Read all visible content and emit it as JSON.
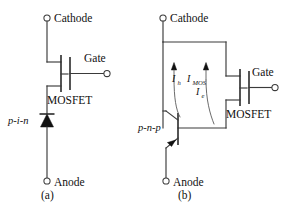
{
  "figure": {
    "caption_a": "(a)",
    "caption_b": "(b)",
    "background": "#ffffff",
    "line_color": "#3a3a3a"
  },
  "circuit_a": {
    "name": "MOS-gated p-i-n diode equivalent circuit",
    "terminals": {
      "top_label": "Cathode",
      "bottom_label": "Anode",
      "gate_label": "Gate"
    },
    "devices": [
      {
        "id": "mosfet-a",
        "label": "MOSFET",
        "type": "n-channel-mosfet"
      },
      {
        "id": "pin-diode-a",
        "label": "p-i-n",
        "type": "diode"
      }
    ],
    "caption": "(a)"
  },
  "circuit_b": {
    "name": "IGBT equivalent circuit with pnp bipolar and MOSFET",
    "terminals": {
      "top_label": "Cathode",
      "bottom_label": "Anode",
      "gate_label": "Gate"
    },
    "devices": [
      {
        "id": "mosfet-b",
        "label": "MOSFET",
        "type": "n-channel-mosfet"
      },
      {
        "id": "pnp-b",
        "label": "p-n-p",
        "type": "pnp-bipolar"
      }
    ],
    "currents": [
      {
        "id": "i-h",
        "symbol": "I",
        "subscript": "h",
        "meaning": "hole current"
      },
      {
        "id": "i-mos",
        "symbol": "I",
        "subscript": "MOS",
        "meaning": "MOSFET channel current"
      },
      {
        "id": "i-e",
        "symbol": "I",
        "subscript": "e",
        "meaning": "electron current"
      }
    ],
    "caption": "(b)"
  }
}
